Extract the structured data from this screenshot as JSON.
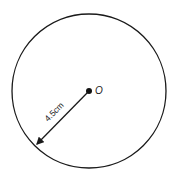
{
  "diagram": {
    "center_label": "O",
    "radius_label": "4.5cm",
    "colors": {
      "stroke": "#1a1a1a",
      "background": "#ffffff"
    }
  }
}
